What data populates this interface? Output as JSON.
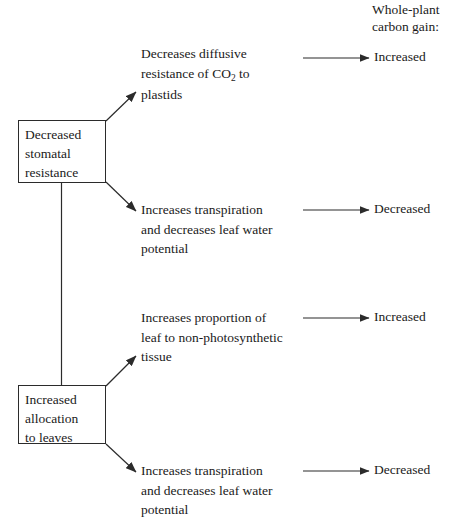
{
  "header": {
    "label": "Whole-plant\ncarbon gain:"
  },
  "nodes": [
    {
      "id": "decreased-stomatal-resistance",
      "label": "Decreased\nstomatal\nresistance"
    },
    {
      "id": "increased-allocation-to-leaves",
      "label": "Increased\nallocation\nto leaves"
    }
  ],
  "effects": [
    {
      "id": "effect-diffusive-resistance",
      "pre": "Decreases diffusive\nresistance of CO",
      "sub": "2",
      "post": " to\nplastids"
    },
    {
      "id": "effect-transpiration-upper",
      "pre": "Increases transpiration\nand decreases leaf water\npotential",
      "sub": "",
      "post": ""
    },
    {
      "id": "effect-nonphotosynthetic-tissue",
      "pre": "Increases proportion of\nleaf to non-photosynthetic\ntissue",
      "sub": "",
      "post": ""
    },
    {
      "id": "effect-transpiration-lower",
      "pre": "Increases transpiration\nand decreases leaf water\npotential",
      "sub": "",
      "post": ""
    }
  ],
  "outcomes": [
    {
      "id": "outcome-1",
      "label": "Increased"
    },
    {
      "id": "outcome-2",
      "label": "Decreased"
    },
    {
      "id": "outcome-3",
      "label": "Increased"
    },
    {
      "id": "outcome-4",
      "label": "Decreased"
    }
  ],
  "style": {
    "line_color": "#2b2b2b",
    "text_color": "#1a1a1a",
    "background": "#ffffff"
  }
}
